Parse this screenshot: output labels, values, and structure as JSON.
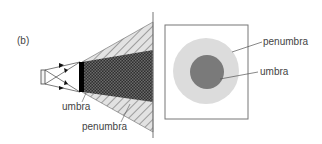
{
  "panel_label": "(b)",
  "left_figure": {
    "labels": {
      "umbra": "umbra",
      "penumbra": "penumbra"
    }
  },
  "right_figure": {
    "labels": {
      "penumbra": "penumbra",
      "umbra": "umbra"
    }
  },
  "colors": {
    "penumbra_fill": "#dcdcdc",
    "umbra_fill": "#7a7a7a",
    "hatch_dark": "#3a3a3a",
    "line": "#555555"
  }
}
